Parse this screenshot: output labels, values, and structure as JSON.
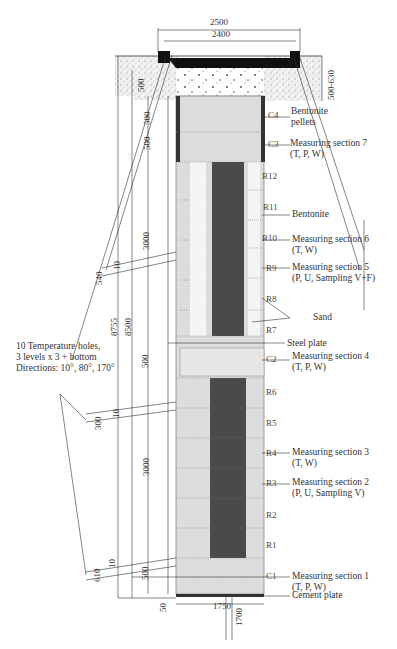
{
  "dimensions": {
    "top_outer": "2500",
    "top_inner": "2400",
    "right_depth": "500-630",
    "top_500_a": "500",
    "top_500_b": "500",
    "top_500_c": "500",
    "upper_3000": "3000",
    "total_8755": "8755",
    "total_8500": "8500",
    "mid_500": "500",
    "lower_3000": "3000",
    "bottom_500": "500",
    "hole_upper_540": "540",
    "hole_upper_offset": "10",
    "hole_mid_300": "300",
    "hole_mid_offset": "10",
    "hole_low_610": "610",
    "hole_low_offset": "10",
    "bottom_50": "50",
    "bottom_width": "1750",
    "bottom_hole": "1700"
  },
  "blocks": {
    "c4": "C4",
    "c3": "C3",
    "r12": "R12",
    "r11": "R11",
    "r10": "R10",
    "r9": "R9",
    "r8": "R8",
    "r7": "R7",
    "c2": "C2",
    "r6": "R6",
    "r5": "R5",
    "r4": "R4",
    "r3": "R3",
    "r2": "R2",
    "r1": "R1",
    "c1": "C1"
  },
  "annotations": {
    "bentonite_pellets_1": "Bentonite",
    "bentonite_pellets_2": "pellets",
    "ms7_1": "Measuring section 7",
    "ms7_2": "(T, P, W)",
    "bentonite": "Bentonite",
    "ms6_1": "Measuring section 6",
    "ms6_2": "(T, W)",
    "ms5_1": "Measuring section 5",
    "ms5_2": "(P, U, Sampling V+F)",
    "sand": "Sand",
    "steel_plate": "Steel plate",
    "ms4_1": "Measuring section 4",
    "ms4_2": "(T, P, W)",
    "ms3_1": "Measuring section 3",
    "ms3_2": "(T, W)",
    "ms2_1": "Measuring section 2",
    "ms2_2": "(P, U, Sampling V)",
    "ms1_1": "Measuring section 1",
    "ms1_2": "(T, P, W)",
    "cement_plate": "Cement plate",
    "temp_1": "10 Temperature holes,",
    "temp_2": "3 levels x 3  + bottom",
    "temp_3": "Directions: 10°, 80°, 170°"
  },
  "colors": {
    "bentonite_fill": "#dcdcdc",
    "heater_core": "#4a4a4a",
    "sand_gap": "#f4f4f4",
    "soil_stipple": "#e8e8e8",
    "line": "#333333"
  }
}
